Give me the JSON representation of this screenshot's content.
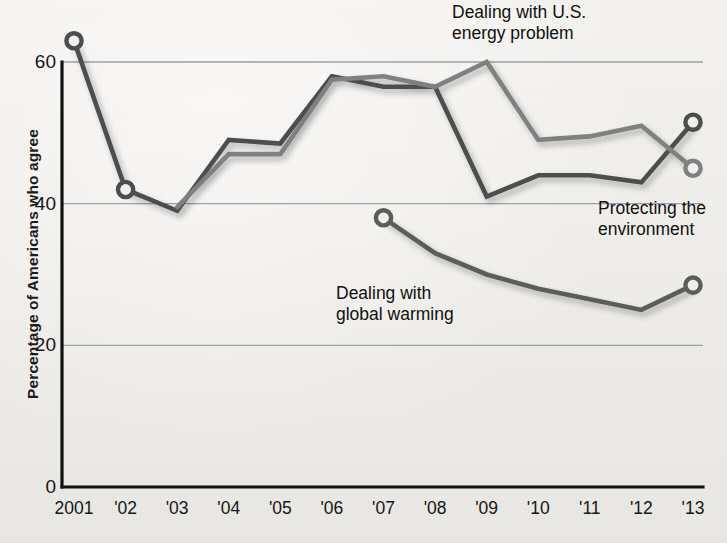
{
  "chart_data": {
    "type": "line",
    "title": "",
    "subtitle": "",
    "xlabel": "",
    "ylabel": "Percentage of Americans who agree",
    "categories": [
      "2001",
      "'02",
      "'03",
      "'04",
      "'05",
      "'06",
      "'07",
      "'08",
      "'09",
      "'10",
      "'11",
      "'12",
      "'13"
    ],
    "x_tick_labels": [
      "2001",
      "'02",
      "'03",
      "'04",
      "'05",
      "'06",
      "'07",
      "'08",
      "'09",
      "'10",
      "'11",
      "'12",
      "'13"
    ],
    "y_tick_labels": [
      "60",
      "40",
      "20",
      "0"
    ],
    "y_tick_values": [
      60,
      40,
      20,
      0
    ],
    "ylim": [
      0,
      66
    ],
    "grid": "horizontal-only",
    "legend": "inline-annotations",
    "series": [
      {
        "name": "Protecting the environment",
        "color": "#4d4d4d",
        "marker_years": [
          "2001",
          "'02",
          "'13"
        ],
        "values": [
          63,
          42,
          39,
          49,
          48.5,
          58,
          56.5,
          56.5,
          41,
          44,
          44,
          43,
          51.5
        ]
      },
      {
        "name": "Dealing with U.S. energy problem",
        "color": "#808080",
        "marker_years": [
          "'13"
        ],
        "values": [
          null,
          null,
          39.5,
          47,
          47,
          57.5,
          58,
          56.5,
          60,
          49,
          49.5,
          51,
          45
        ]
      },
      {
        "name": "Dealing with global warming",
        "color": "#5c5c5c",
        "marker_years": [
          "'07",
          "'13"
        ],
        "values": [
          null,
          null,
          null,
          null,
          null,
          null,
          38,
          33,
          30,
          28,
          26.5,
          25,
          28.5
        ]
      }
    ],
    "annotations": [
      {
        "id": "energy",
        "text": "Dealing with U.S.\nenergy problem"
      },
      {
        "id": "warming",
        "text": "Dealing with\nglobal warming"
      },
      {
        "id": "environment",
        "text": "Protecting the\nenvironment"
      }
    ]
  },
  "colors": {
    "background": "#f1efec",
    "axis": "#111111",
    "gridline": "#9aa0a6",
    "text": "#141414",
    "series_environment": "#4d4d4d",
    "series_energy": "#808080",
    "series_warming": "#5c5c5c"
  }
}
